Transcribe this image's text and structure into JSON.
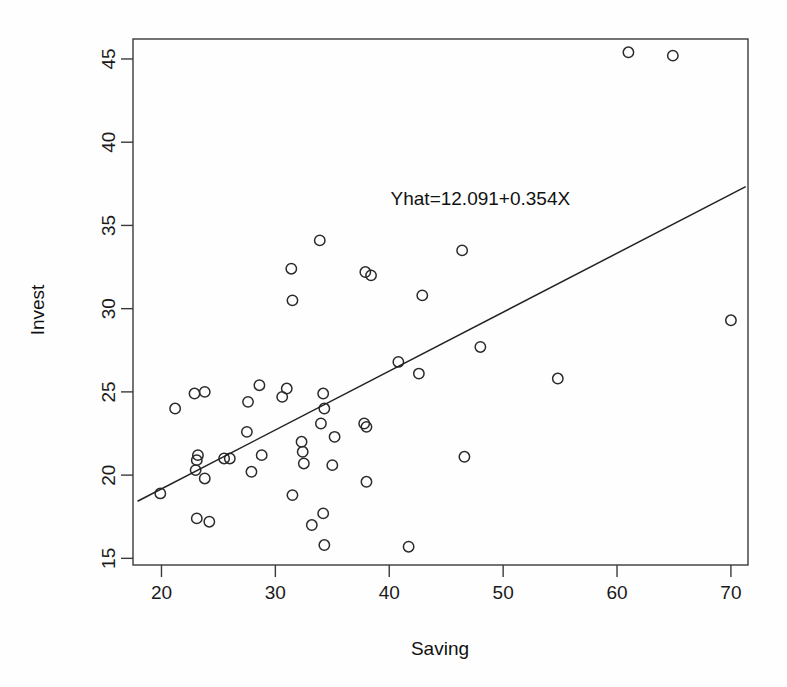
{
  "figure": {
    "background_color": "#ffffff",
    "foreground_color": "#1a1a1a",
    "marker_color": "#2b2b2b",
    "line_color": "#222222"
  },
  "chart_data": {
    "type": "scatter",
    "title": "",
    "xlabel": "Saving",
    "ylabel": "Invest",
    "xlim": [
      17.5,
      71.5
    ],
    "ylim": [
      14.6,
      46.2
    ],
    "grid": false,
    "legend": null,
    "xticks": [
      20,
      30,
      40,
      50,
      60,
      70
    ],
    "xticklabels": [
      "20",
      "30",
      "40",
      "50",
      "60",
      "70"
    ],
    "yticks": [
      15,
      20,
      25,
      30,
      35,
      40,
      45
    ],
    "yticklabels": [
      "15",
      "20",
      "25",
      "30",
      "35",
      "40",
      "45"
    ],
    "marker": "open-circle",
    "annotations": [
      {
        "text": "Yhat=12.091+0.354X",
        "x": 48.0,
        "y": 36.2,
        "name": "regression-equation-label"
      }
    ],
    "fit_line": {
      "name": "least-squares-regression-line",
      "equation": "Yhat=12.091+0.354X",
      "intercept": 12.091,
      "slope": 0.354,
      "x_start": 17.9,
      "x_end": 71.3,
      "y_start": 18.43,
      "y_end": 37.33
    },
    "points": [
      {
        "x": 19.9,
        "y": 18.9
      },
      {
        "x": 21.2,
        "y": 24.0
      },
      {
        "x": 22.9,
        "y": 24.9
      },
      {
        "x": 23.0,
        "y": 20.3
      },
      {
        "x": 23.1,
        "y": 20.9
      },
      {
        "x": 23.2,
        "y": 21.2
      },
      {
        "x": 23.1,
        "y": 17.4
      },
      {
        "x": 23.8,
        "y": 25.0
      },
      {
        "x": 23.8,
        "y": 19.8
      },
      {
        "x": 24.2,
        "y": 17.2
      },
      {
        "x": 25.5,
        "y": 21.0
      },
      {
        "x": 26.0,
        "y": 21.0
      },
      {
        "x": 27.6,
        "y": 24.4
      },
      {
        "x": 27.5,
        "y": 22.6
      },
      {
        "x": 27.9,
        "y": 20.2
      },
      {
        "x": 28.6,
        "y": 25.4
      },
      {
        "x": 28.8,
        "y": 21.2
      },
      {
        "x": 30.6,
        "y": 24.7
      },
      {
        "x": 31.0,
        "y": 25.2
      },
      {
        "x": 31.4,
        "y": 32.4
      },
      {
        "x": 31.5,
        "y": 30.5
      },
      {
        "x": 31.5,
        "y": 18.8
      },
      {
        "x": 32.3,
        "y": 22.0
      },
      {
        "x": 32.4,
        "y": 21.4
      },
      {
        "x": 32.5,
        "y": 20.7
      },
      {
        "x": 33.2,
        "y": 17.0
      },
      {
        "x": 33.9,
        "y": 34.1
      },
      {
        "x": 34.0,
        "y": 23.1
      },
      {
        "x": 34.2,
        "y": 24.9
      },
      {
        "x": 34.3,
        "y": 24.0
      },
      {
        "x": 34.2,
        "y": 17.7
      },
      {
        "x": 34.3,
        "y": 15.8
      },
      {
        "x": 35.2,
        "y": 22.3
      },
      {
        "x": 35.0,
        "y": 20.6
      },
      {
        "x": 37.9,
        "y": 32.2
      },
      {
        "x": 38.4,
        "y": 32.0
      },
      {
        "x": 37.8,
        "y": 23.1
      },
      {
        "x": 38.0,
        "y": 22.9
      },
      {
        "x": 38.0,
        "y": 19.6
      },
      {
        "x": 40.8,
        "y": 26.8
      },
      {
        "x": 41.7,
        "y": 15.7
      },
      {
        "x": 42.6,
        "y": 26.1
      },
      {
        "x": 42.9,
        "y": 30.8
      },
      {
        "x": 46.4,
        "y": 33.5
      },
      {
        "x": 46.6,
        "y": 21.1
      },
      {
        "x": 48.0,
        "y": 27.7
      },
      {
        "x": 54.8,
        "y": 25.8
      },
      {
        "x": 61.0,
        "y": 45.4
      },
      {
        "x": 64.9,
        "y": 45.2
      },
      {
        "x": 70.0,
        "y": 29.3
      }
    ]
  }
}
